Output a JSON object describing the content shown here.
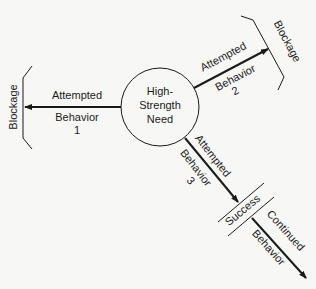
{
  "diagram": {
    "center_node": {
      "line1": "High-",
      "line2": "Strength",
      "line3": "Need"
    },
    "paths": [
      {
        "id": "behavior-1",
        "label_top": "Attempted",
        "label_bottom": "Behavior",
        "number": "1",
        "outcome": "Blockage"
      },
      {
        "id": "behavior-2",
        "label_top": "Attempted",
        "label_bottom": "Behavior",
        "number": "2",
        "outcome": "Blockage"
      },
      {
        "id": "behavior-3",
        "label_top": "Attempted",
        "label_bottom": "Behavior",
        "number": "3",
        "outcome": "Success",
        "continuation_top": "Continued",
        "continuation_bottom": "Behavior"
      }
    ]
  },
  "colors": {
    "background": "#f7f7f5",
    "ink": "#1a1a1a"
  }
}
